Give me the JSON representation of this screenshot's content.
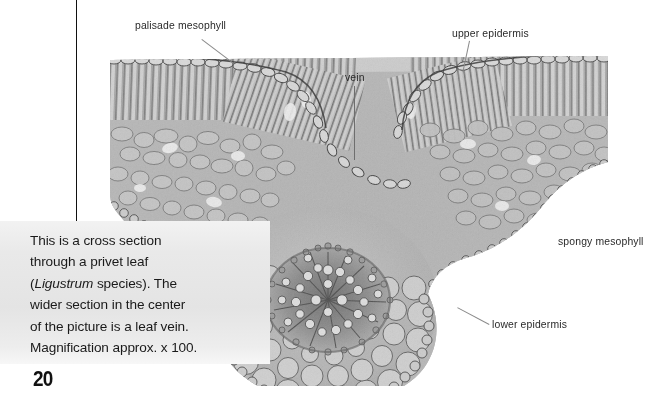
{
  "page": {
    "number": "20",
    "background": "#ffffff"
  },
  "caption": {
    "lines": [
      "This is a cross section",
      "through a privet leaf",
      "(Ligustrum species). The",
      "wider section in the center",
      "of the picture is a leaf vein.",
      "Magnification approx. x 100."
    ],
    "italic_term": "Ligustrum",
    "background_color": "#e9e9e9",
    "text_color": "#1a1a1a"
  },
  "figure": {
    "magnification": "x 100",
    "specimen": "Ligustrum species (privet) leaf",
    "labels": [
      {
        "id": "palisade-mesophyll",
        "text": "palisade mesophyll",
        "x": 135,
        "y": 20
      },
      {
        "id": "upper-epidermis",
        "text": "upper epidermis",
        "x": 452,
        "y": 28
      },
      {
        "id": "vein",
        "text": "vein",
        "x": 345,
        "y": 72
      },
      {
        "id": "spongy-mesophyll",
        "text": "spongy mesophyll",
        "x": 558,
        "y": 236
      },
      {
        "id": "lower-epidermis",
        "text": "lower epidermis",
        "x": 492,
        "y": 319
      }
    ],
    "label_color": "#2a2a2a",
    "leader_color": "#8a8a8a"
  }
}
